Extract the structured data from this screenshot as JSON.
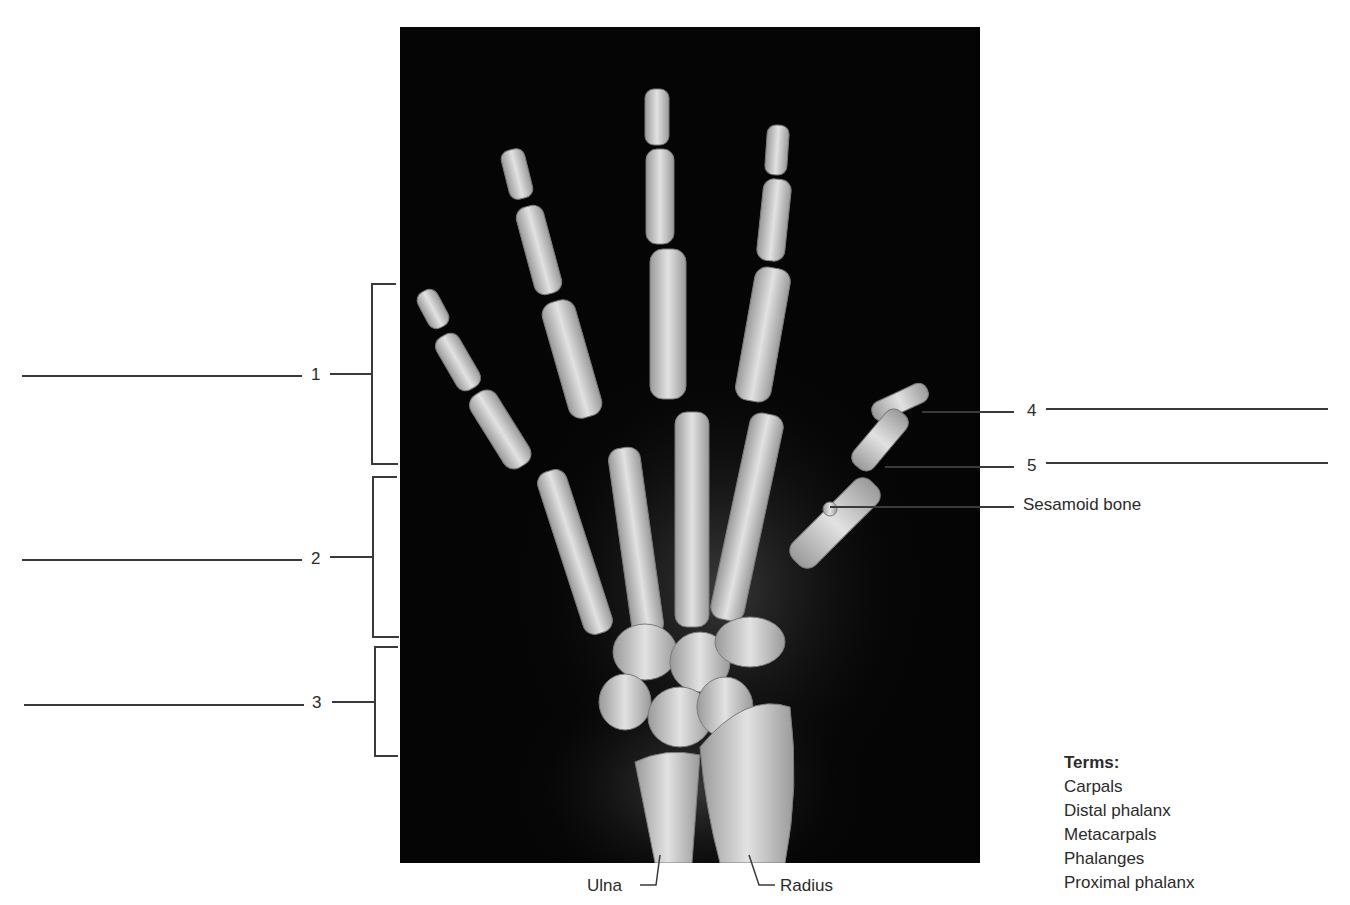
{
  "figure": {
    "numbered_labels": [
      {
        "id": "1",
        "text": "1",
        "blank": true,
        "side": "left",
        "bracket": true
      },
      {
        "id": "2",
        "text": "2",
        "blank": true,
        "side": "left",
        "bracket": true
      },
      {
        "id": "3",
        "text": "3",
        "blank": true,
        "side": "left",
        "bracket": true
      },
      {
        "id": "4",
        "text": "4",
        "blank": true,
        "side": "right"
      },
      {
        "id": "5",
        "text": "5",
        "blank": true,
        "side": "right"
      }
    ],
    "named_labels": {
      "sesamoid": "Sesamoid bone",
      "ulna": "Ulna",
      "radius": "Radius"
    },
    "terms": {
      "title": "Terms:",
      "items": [
        "Carpals",
        "Distal phalanx",
        "Metacarpals",
        "Phalanges",
        "Proximal phalanx"
      ]
    },
    "colors": {
      "background": "#ffffff",
      "xray_background": "#050505",
      "bone": "#d8d8d8",
      "text": "#2b2b2b",
      "leader_line": "#3a3a3a"
    }
  }
}
